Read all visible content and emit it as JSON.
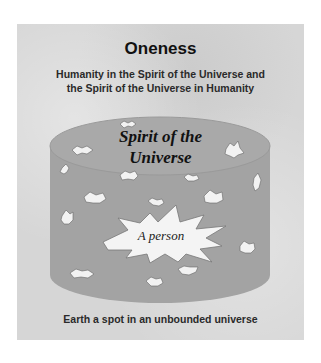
{
  "title": "Oneness",
  "subtitle_line1": "Humanity in the Spirit of the Universe and",
  "subtitle_line2": "the Spirit of the Universe in Humanity",
  "cylinder": {
    "label_line1": "Spirit of the",
    "label_line2": "Universe",
    "fill_color": "#a3a3a3",
    "top_color": "#a8a8a8"
  },
  "center_burst": {
    "label": "A person",
    "fill_color": "#f4f4f4"
  },
  "caption": "Earth a spot in an unbounded universe",
  "background_color": "#d6d6d6"
}
